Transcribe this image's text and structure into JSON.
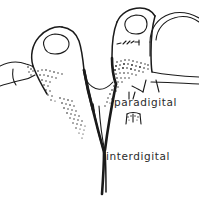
{
  "figure": {
    "background_color": "#ffffff",
    "ink_color": "#1a1a1a",
    "text_color": "#2b2b2b",
    "width": 199,
    "height": 198
  },
  "labels": [
    {
      "id": "paradigital",
      "text": "paradigital",
      "x": 114,
      "y": 106,
      "describes": "shaded web band along the side of the finger base"
    },
    {
      "id": "interdigital",
      "text": "interdigital",
      "x": 106,
      "y": 160,
      "describes": "deep V-shaped cleft between the two fingers"
    }
  ],
  "parts": [
    {
      "id": "left-finger",
      "name": "left finger",
      "interactable": false
    },
    {
      "id": "right-finger",
      "name": "right finger",
      "interactable": false
    },
    {
      "id": "partial-finger-left",
      "name": "partial third finger at left edge",
      "interactable": false
    },
    {
      "id": "adjacent-finger-top-right",
      "name": "adjacent finger at top right",
      "interactable": false
    },
    {
      "id": "left-fingernail",
      "name": "left fingernail",
      "interactable": false
    },
    {
      "id": "right-fingernail",
      "name": "right fingernail",
      "interactable": false
    },
    {
      "id": "interdigital-cleft",
      "name": "interdigital cleft",
      "interactable": false
    },
    {
      "id": "paradigital-web",
      "name": "paradigital web shading",
      "interactable": false
    },
    {
      "id": "palm-creases",
      "name": "palm crease lines",
      "interactable": false
    },
    {
      "id": "leader-line-interdigital",
      "name": "leader line to interdigital cleft",
      "interactable": false
    },
    {
      "id": "leader-line-paradigital",
      "name": "leader line to paradigital band",
      "interactable": false
    }
  ]
}
